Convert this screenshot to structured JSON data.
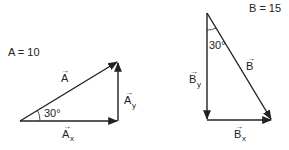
{
  "diagram": {
    "colors": {
      "stroke": "#222222",
      "background": "#ffffff"
    },
    "left": {
      "magnitude_label": "A = 10",
      "vector_label": "A",
      "x_component_label": "A",
      "x_sub": "x",
      "y_component_label": "A",
      "y_sub": "y",
      "angle_label": "30°",
      "arrow_glyph": "→"
    },
    "right": {
      "magnitude_label": "B = 15",
      "vector_label": "B",
      "x_component_label": "B",
      "x_sub": "x",
      "y_component_label": "B",
      "y_sub": "y",
      "angle_label": "30°",
      "arrow_glyph": "→"
    }
  }
}
